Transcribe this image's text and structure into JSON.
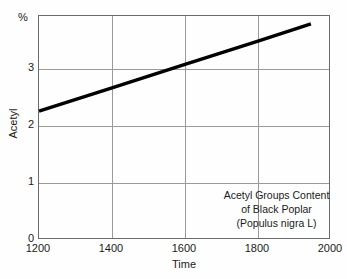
{
  "chart_data": {
    "type": "line",
    "title": "",
    "xlabel": "Time",
    "ylabel": "Acetyl",
    "unit_label": "%",
    "xlim": [
      1200,
      2000
    ],
    "ylim": [
      0,
      3.93
    ],
    "grid": true,
    "legend": "none",
    "xticks": [
      1200,
      1400,
      1600,
      1800,
      2000
    ],
    "xtick_labels": [
      "1200",
      "1400",
      "1600",
      "1800",
      "2000"
    ],
    "yticks": [
      0,
      1,
      2,
      3
    ],
    "ytick_labels": [
      "0",
      "1",
      "2",
      "3"
    ],
    "series": [
      {
        "name": "Acetyl groups content",
        "x": [
          1200,
          1400,
          1600,
          1800,
          1945
        ],
        "values": [
          2.26,
          2.67,
          3.08,
          3.49,
          3.79
        ]
      }
    ],
    "annotations": [
      "Acetyl Groups Content",
      "of Black Poplar",
      "(Populus nigra L)"
    ],
    "colors": {
      "line": "#000000",
      "grid": "#9a9a9a",
      "frame": "#6b6b6b",
      "background": "#fefefe",
      "text": "#1a1a1a"
    }
  }
}
